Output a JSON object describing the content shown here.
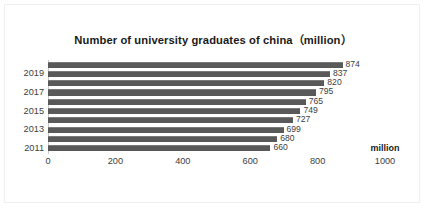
{
  "chart_data": {
    "type": "bar",
    "orientation": "horizontal",
    "title": "Number of university graduates of china（million）",
    "xlabel": "million",
    "ylabel": "",
    "xlim": [
      0,
      1000
    ],
    "xticks": [
      0,
      200,
      400,
      600,
      800,
      1000
    ],
    "xtick_labels": [
      "0",
      "200",
      "400",
      "600",
      "800",
      "1000"
    ],
    "categories": [
      "2011",
      "2012",
      "2013",
      "2014",
      "2015",
      "2016",
      "2017",
      "2018",
      "2019",
      "2020"
    ],
    "visible_ytick_labels": [
      "2011",
      "2013",
      "2015",
      "2017",
      "2019"
    ],
    "values": [
      660,
      680,
      699,
      727,
      749,
      765,
      795,
      820,
      837,
      874
    ],
    "bars": [
      {
        "category": "2020",
        "value": 874,
        "label": "874",
        "show_ytick": false,
        "ytick_label": ""
      },
      {
        "category": "2019",
        "value": 837,
        "label": "837",
        "show_ytick": true,
        "ytick_label": "2019"
      },
      {
        "category": "2018",
        "value": 820,
        "label": "820",
        "show_ytick": false,
        "ytick_label": ""
      },
      {
        "category": "2017",
        "value": 795,
        "label": "795",
        "show_ytick": true,
        "ytick_label": "2017"
      },
      {
        "category": "2016",
        "value": 765,
        "label": "765",
        "show_ytick": false,
        "ytick_label": ""
      },
      {
        "category": "2015",
        "value": 749,
        "label": "749",
        "show_ytick": true,
        "ytick_label": "2015"
      },
      {
        "category": "2014",
        "value": 727,
        "label": "727",
        "show_ytick": false,
        "ytick_label": ""
      },
      {
        "category": "2013",
        "value": 699,
        "label": "699",
        "show_ytick": true,
        "ytick_label": "2013"
      },
      {
        "category": "2012",
        "value": 680,
        "label": "680",
        "show_ytick": false,
        "ytick_label": ""
      },
      {
        "category": "2011",
        "value": 660,
        "label": "660",
        "show_ytick": true,
        "ytick_label": "2011"
      }
    ],
    "grid": false,
    "legend": null,
    "colors": {
      "bar": "#595959",
      "bar_highlight": "#7a7a7a",
      "title_text": "#1a1a1a",
      "tick_text": "#3d3d3d",
      "data_label_text": "#3d3d3d",
      "axis_line": "#c8c8c8",
      "frame_border": "#f0f0f0",
      "background": "#ffffff"
    }
  }
}
